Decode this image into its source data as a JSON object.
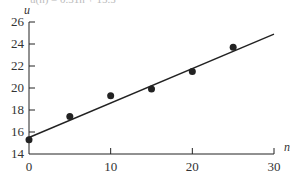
{
  "chart_data": {
    "type": "scatter",
    "title": "",
    "equation": "û(n) = 0.31n + 15.5",
    "xlabel": "n",
    "ylabel": "u",
    "xlim": [
      0,
      30
    ],
    "ylim": [
      14,
      26
    ],
    "x_ticks": [
      0,
      10,
      20,
      30
    ],
    "y_ticks": [
      14,
      16,
      18,
      20,
      22,
      24,
      26
    ],
    "grid": false,
    "legend": null,
    "series": [
      {
        "name": "data",
        "type": "scatter",
        "x": [
          0,
          5,
          10,
          15,
          20,
          25
        ],
        "y": [
          15.3,
          17.4,
          19.3,
          19.9,
          21.5,
          23.7
        ]
      },
      {
        "name": "fit line",
        "type": "line",
        "x": [
          0,
          30
        ],
        "y": [
          15.5,
          24.9
        ]
      }
    ]
  },
  "colors": {
    "ink": "#222222"
  }
}
